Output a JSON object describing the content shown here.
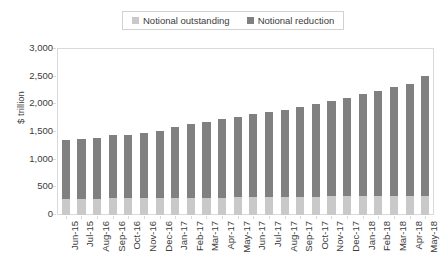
{
  "legend": {
    "position": "top-center",
    "entries": [
      {
        "label": "Notional outstanding",
        "color": "#c9c9c9",
        "swatch_name": "legend-swatch-outstanding"
      },
      {
        "label": "Notional reduction",
        "color": "#808080",
        "swatch_name": "legend-swatch-reduction"
      }
    ]
  },
  "chart_data": {
    "type": "bar",
    "title": "",
    "subtitle": "",
    "xlabel": "",
    "ylabel": "$ trillion",
    "ylim": [
      0,
      3000
    ],
    "ytick_labels": [
      "3,000",
      "2,500",
      "2,000",
      "1,500",
      "1,000",
      "500",
      "0"
    ],
    "ytick_values": [
      3000,
      2500,
      2000,
      1500,
      1000,
      500,
      0
    ],
    "grid": false,
    "stacked": true,
    "categories": [
      "Jun-15",
      "Jul-15",
      "Aug-16",
      "Sep-16",
      "Oct-16",
      "Nov-16",
      "Dec-16",
      "Jan-17",
      "Feb-17",
      "Mar-17",
      "Apr-17",
      "May-17",
      "Jun-17",
      "Jul-17",
      "Aug-17",
      "Sep-17",
      "Oct-17",
      "Nov-17",
      "Dec-17",
      "Jan-18",
      "Feb-18",
      "Mar-18",
      "Apr-18",
      "May-18"
    ],
    "series": [
      {
        "name": "Notional outstanding",
        "color": "#c9c9c9",
        "values": [
          290,
          290,
          295,
          300,
          300,
          305,
          305,
          310,
          310,
          315,
          315,
          320,
          320,
          325,
          325,
          330,
          330,
          335,
          335,
          340,
          340,
          345,
          345,
          350
        ]
      },
      {
        "name": "Notional reduction",
        "color": "#808080",
        "values": [
          1060,
          1080,
          1105,
          1140,
          1155,
          1175,
          1215,
          1285,
          1330,
          1375,
          1420,
          1455,
          1500,
          1540,
          1580,
          1620,
          1670,
          1730,
          1785,
          1845,
          1910,
          1965,
          2025,
          2160
        ]
      }
    ],
    "totals": [
      1350,
      1370,
      1400,
      1440,
      1455,
      1480,
      1520,
      1595,
      1640,
      1690,
      1735,
      1775,
      1820,
      1865,
      1905,
      1950,
      2000,
      2065,
      2120,
      2185,
      2250,
      2310,
      2370,
      2510
    ]
  }
}
